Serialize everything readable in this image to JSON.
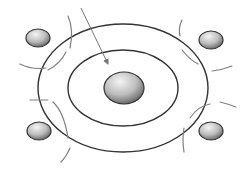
{
  "diagram": {
    "colors": {
      "background": "#ffffff",
      "ring_stroke": "#333333",
      "arc_stroke": "#777777",
      "arrow_stroke": "#777777",
      "sphere_light": "#f2f2f2",
      "sphere_dark": "#6e6e6e",
      "sphere_outline": "#333333"
    },
    "rings": [
      {
        "name": "outer-ring",
        "cx": 123,
        "cy": 88,
        "rx": 85,
        "ry": 64
      },
      {
        "name": "middle-ring",
        "cx": 123,
        "cy": 88,
        "rx": 55,
        "ry": 38
      }
    ],
    "center_sphere": {
      "cx": 124,
      "cy": 88,
      "rx": 20,
      "ry": 16
    },
    "outer_spheres": [
      {
        "name": "sphere-top-left",
        "cx": 38,
        "cy": 38,
        "rx": 12,
        "ry": 9
      },
      {
        "name": "sphere-top-right",
        "cx": 211,
        "cy": 40,
        "rx": 12,
        "ry": 9
      },
      {
        "name": "sphere-bottom-left",
        "cx": 39,
        "cy": 131,
        "rx": 12,
        "ry": 9
      },
      {
        "name": "sphere-bottom-right",
        "cx": 211,
        "cy": 131,
        "rx": 12,
        "ry": 9
      }
    ]
  }
}
